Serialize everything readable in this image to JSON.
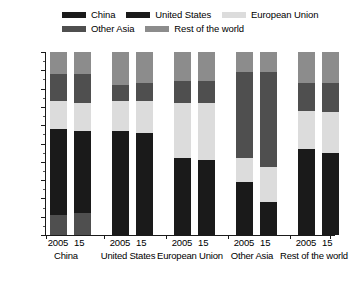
{
  "legend": {
    "rows": [
      [
        {
          "label": "China",
          "color": "#1a1a1a",
          "key": "china"
        },
        {
          "label": "United States",
          "color": "#1a1a1a",
          "key": "united-states"
        },
        {
          "label": "European Union",
          "color": "#dcdcdc",
          "key": "european-union"
        }
      ],
      [
        {
          "label": "Other Asia",
          "color": "#4f4f4f",
          "key": "other-asia"
        },
        {
          "label": "Rest of the world",
          "color": "#8c8c8c",
          "key": "rest-of-the-world"
        }
      ]
    ]
  },
  "axis": {
    "y_labels": [
      "100",
      "90",
      "80",
      "70",
      "60",
      "50",
      "40",
      "30",
      "20",
      "10",
      "0"
    ],
    "y_values": [
      100,
      90,
      80,
      70,
      60,
      50,
      40,
      30,
      20,
      10,
      0
    ]
  },
  "groups": [
    {
      "name": "China",
      "years": [
        "2005",
        "15"
      ]
    },
    {
      "name": "United States",
      "years": [
        "2005",
        "15"
      ]
    },
    {
      "name": "European Union",
      "years": [
        "2005",
        "15"
      ]
    },
    {
      "name": "Other Asia",
      "years": [
        "2005",
        "15"
      ]
    },
    {
      "name": "Rest of the world",
      "years": [
        "2005",
        "15"
      ]
    }
  ],
  "chart_data": {
    "type": "bar",
    "stacked": true,
    "title": "",
    "xlabel": "",
    "ylabel": "",
    "ylim": [
      0,
      100
    ],
    "ytick_step": 10,
    "yminor_step": 5,
    "grid": false,
    "legend_position": "top",
    "categories": [
      "China 2005",
      "China 15",
      "United States 2005",
      "United States 15",
      "European Union 2005",
      "European Union 15",
      "Other Asia 2005",
      "Other Asia 15",
      "Rest of the world 2005",
      "Rest of the world 15"
    ],
    "groups": [
      "China",
      "United States",
      "European Union",
      "Other Asia",
      "Rest of the world"
    ],
    "years": [
      "2005",
      "15"
    ],
    "series": [
      {
        "name": "China",
        "color": "#1a1a1a",
        "values": [
          46,
          44,
          57,
          56,
          42,
          41,
          29,
          18,
          47,
          45
        ]
      },
      {
        "name": "European Union",
        "color": "#dcdcdc",
        "values": [
          15,
          16,
          16,
          17,
          30,
          31,
          13,
          19,
          21,
          22
        ]
      },
      {
        "name": "Other Asia",
        "color": "#4f4f4f",
        "values": [
          27,
          28,
          9,
          10,
          12,
          12,
          47,
          52,
          15,
          16
        ]
      },
      {
        "name": "Rest of the world",
        "color": "#8c8c8c",
        "values": [
          12,
          12,
          18,
          17,
          16,
          16,
          11,
          11,
          17,
          17
        ]
      }
    ],
    "stack_order_bottom_to_top": [
      "Other Asia",
      "China",
      "European Union",
      "Other Asia",
      "Rest of the world"
    ],
    "bars": [
      {
        "category": "China 2005",
        "segments": [
          {
            "name": "Other Asia",
            "color": "#4f4f4f",
            "from": 0,
            "to": 11
          },
          {
            "name": "China",
            "color": "#1a1a1a",
            "from": 11,
            "to": 58
          },
          {
            "name": "European Union",
            "color": "#dcdcdc",
            "from": 58,
            "to": 73
          },
          {
            "name": "Other Asia",
            "color": "#4f4f4f",
            "from": 73,
            "to": 88
          },
          {
            "name": "Rest of the world",
            "color": "#8c8c8c",
            "from": 88,
            "to": 100
          }
        ]
      },
      {
        "category": "China 15",
        "segments": [
          {
            "name": "Other Asia",
            "color": "#4f4f4f",
            "from": 0,
            "to": 12
          },
          {
            "name": "China",
            "color": "#1a1a1a",
            "from": 12,
            "to": 57
          },
          {
            "name": "European Union",
            "color": "#dcdcdc",
            "from": 57,
            "to": 72
          },
          {
            "name": "Other Asia",
            "color": "#4f4f4f",
            "from": 72,
            "to": 88
          },
          {
            "name": "Rest of the world",
            "color": "#8c8c8c",
            "from": 88,
            "to": 100
          }
        ]
      },
      {
        "category": "United States 2005",
        "segments": [
          {
            "name": "United States",
            "color": "#1a1a1a",
            "from": 0,
            "to": 57
          },
          {
            "name": "European Union",
            "color": "#dcdcdc",
            "from": 57,
            "to": 73
          },
          {
            "name": "Other Asia",
            "color": "#4f4f4f",
            "from": 73,
            "to": 82
          },
          {
            "name": "Rest of the world",
            "color": "#8c8c8c",
            "from": 82,
            "to": 100
          }
        ]
      },
      {
        "category": "United States 15",
        "segments": [
          {
            "name": "United States",
            "color": "#1a1a1a",
            "from": 0,
            "to": 56
          },
          {
            "name": "European Union",
            "color": "#dcdcdc",
            "from": 56,
            "to": 73
          },
          {
            "name": "Other Asia",
            "color": "#4f4f4f",
            "from": 73,
            "to": 83
          },
          {
            "name": "Rest of the world",
            "color": "#8c8c8c",
            "from": 83,
            "to": 100
          }
        ]
      },
      {
        "category": "European Union 2005",
        "segments": [
          {
            "name": "European Union",
            "color": "#1a1a1a",
            "from": 0,
            "to": 42
          },
          {
            "name": "European Union",
            "color": "#dcdcdc",
            "from": 42,
            "to": 72
          },
          {
            "name": "Other Asia",
            "color": "#4f4f4f",
            "from": 72,
            "to": 84
          },
          {
            "name": "Rest of the world",
            "color": "#8c8c8c",
            "from": 84,
            "to": 100
          }
        ]
      },
      {
        "category": "European Union 15",
        "segments": [
          {
            "name": "European Union",
            "color": "#1a1a1a",
            "from": 0,
            "to": 41
          },
          {
            "name": "European Union",
            "color": "#dcdcdc",
            "from": 41,
            "to": 72
          },
          {
            "name": "Other Asia",
            "color": "#4f4f4f",
            "from": 72,
            "to": 84
          },
          {
            "name": "Rest of the world",
            "color": "#8c8c8c",
            "from": 84,
            "to": 100
          }
        ]
      },
      {
        "category": "Other Asia 2005",
        "segments": [
          {
            "name": "Other Asia",
            "color": "#1a1a1a",
            "from": 0,
            "to": 29
          },
          {
            "name": "European Union",
            "color": "#dcdcdc",
            "from": 29,
            "to": 42
          },
          {
            "name": "Other Asia",
            "color": "#4f4f4f",
            "from": 42,
            "to": 89
          },
          {
            "name": "Rest of the world",
            "color": "#8c8c8c",
            "from": 89,
            "to": 100
          }
        ]
      },
      {
        "category": "Other Asia 15",
        "segments": [
          {
            "name": "Other Asia",
            "color": "#1a1a1a",
            "from": 0,
            "to": 18
          },
          {
            "name": "European Union",
            "color": "#dcdcdc",
            "from": 18,
            "to": 37
          },
          {
            "name": "Other Asia",
            "color": "#4f4f4f",
            "from": 37,
            "to": 89
          },
          {
            "name": "Rest of the world",
            "color": "#8c8c8c",
            "from": 89,
            "to": 100
          }
        ]
      },
      {
        "category": "Rest of the world 2005",
        "segments": [
          {
            "name": "Rest of the world",
            "color": "#1a1a1a",
            "from": 0,
            "to": 47
          },
          {
            "name": "European Union",
            "color": "#dcdcdc",
            "from": 47,
            "to": 68
          },
          {
            "name": "Other Asia",
            "color": "#4f4f4f",
            "from": 68,
            "to": 83
          },
          {
            "name": "Rest of the world",
            "color": "#8c8c8c",
            "from": 83,
            "to": 100
          }
        ]
      },
      {
        "category": "Rest of the world 15",
        "segments": [
          {
            "name": "Rest of the world",
            "color": "#1a1a1a",
            "from": 0,
            "to": 45
          },
          {
            "name": "European Union",
            "color": "#dcdcdc",
            "from": 45,
            "to": 67
          },
          {
            "name": "Other Asia",
            "color": "#4f4f4f",
            "from": 67,
            "to": 83
          },
          {
            "name": "Rest of the world",
            "color": "#8c8c8c",
            "from": 83,
            "to": 100
          }
        ]
      }
    ]
  },
  "layout": {
    "group_x": [
      0,
      62,
      124,
      186,
      248
    ],
    "bar_offsets": [
      4,
      28
    ],
    "xlabel_group_left": [
      26,
      88,
      150,
      212,
      274
    ],
    "xlabel_group_width": [
      80,
      80,
      80,
      80,
      80
    ]
  }
}
